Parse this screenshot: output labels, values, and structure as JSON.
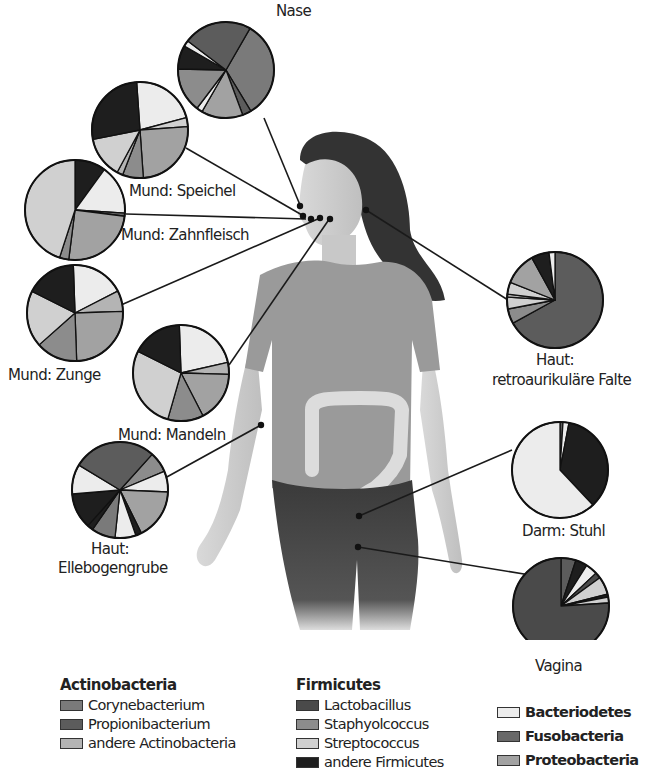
{
  "legend": {
    "groups": [
      {
        "title": "Actinobacteria",
        "items": [
          {
            "key": "cory",
            "label": "Corynebacterium",
            "color": "#7a7a7a"
          },
          {
            "key": "prop",
            "label": "Propionibacterium",
            "color": "#5c5c5c"
          },
          {
            "key": "acto",
            "label": "andere Actinobacteria",
            "color": "#b4b4b4"
          }
        ]
      },
      {
        "title": "Firmicutes",
        "items": [
          {
            "key": "lact",
            "label": "Lactobacillus",
            "color": "#4a4a4a"
          },
          {
            "key": "stap",
            "label": "Staphyolcoccus",
            "color": "#8c8c8c"
          },
          {
            "key": "stre",
            "label": "Streptococcus",
            "color": "#d0d0d0"
          },
          {
            "key": "firo",
            "label": "andere Firmicutes",
            "color": "#1e1e1e"
          }
        ]
      },
      {
        "title": "",
        "items": [
          {
            "key": "bact",
            "label": "Bacteriodetes",
            "color": "#ececec"
          },
          {
            "key": "fuso",
            "label": "Fusobacteria",
            "color": "#686868"
          },
          {
            "key": "prot",
            "label": "Proteobacteria",
            "color": "#a2a2a2"
          }
        ]
      }
    ]
  },
  "chart_data": {
    "type": "pie",
    "legend_position": "bottom",
    "series": [
      {
        "name": "Nase",
        "cx": 226,
        "cy": 70,
        "r": 48,
        "start": -60,
        "slices": [
          [
            "cory",
            33
          ],
          [
            "prop",
            3
          ],
          [
            "prot",
            14
          ],
          [
            "bact",
            2
          ],
          [
            "stap",
            15
          ],
          [
            "firo",
            8
          ],
          [
            "bact",
            2
          ],
          [
            "prop",
            23
          ]
        ]
      },
      {
        "name": "Mund: Speichel",
        "cx": 140,
        "cy": 130,
        "r": 48,
        "start": -94,
        "slices": [
          [
            "bact",
            22
          ],
          [
            "stre",
            3
          ],
          [
            "prot",
            25
          ],
          [
            "stap",
            7
          ],
          [
            "acto",
            2
          ],
          [
            "stre",
            14
          ],
          [
            "firo",
            27
          ]
        ]
      },
      {
        "name": "Mund: Zahnfleisch",
        "cx": 75,
        "cy": 210,
        "r": 50,
        "start": -90,
        "slices": [
          [
            "firo",
            10
          ],
          [
            "bact",
            16
          ],
          [
            "fuso",
            1
          ],
          [
            "prot",
            25
          ],
          [
            "stap",
            3
          ],
          [
            "stre",
            45
          ]
        ]
      },
      {
        "name": "Mund: Zunge",
        "cx": 75,
        "cy": 313,
        "r": 48,
        "start": -92,
        "slices": [
          [
            "bact",
            18
          ],
          [
            "acto",
            7
          ],
          [
            "prot",
            25
          ],
          [
            "stap",
            14
          ],
          [
            "stre",
            19
          ],
          [
            "firo",
            17
          ]
        ]
      },
      {
        "name": "Mund: Mandeln",
        "cx": 181,
        "cy": 373,
        "r": 48,
        "start": -92,
        "slices": [
          [
            "bact",
            22
          ],
          [
            "acto",
            4
          ],
          [
            "prot",
            17
          ],
          [
            "stap",
            12
          ],
          [
            "stre",
            28
          ],
          [
            "firo",
            17
          ]
        ]
      },
      {
        "name": "Haut: Ellebogengrube",
        "cx": 120,
        "cy": 490,
        "r": 48,
        "start": -48,
        "slices": [
          [
            "stap",
            7
          ],
          [
            "bact",
            7
          ],
          [
            "prot",
            17
          ],
          [
            "firo",
            2
          ],
          [
            "bact",
            7
          ],
          [
            "cory",
            8
          ],
          [
            "firo",
            2
          ],
          [
            "firo",
            12
          ],
          [
            "bact",
            10
          ],
          [
            "prop",
            28
          ]
        ]
      },
      {
        "name": "Haut: retroaurikuläre Falte",
        "cx": 555,
        "cy": 300,
        "r": 48,
        "start": -90,
        "slices": [
          [
            "prop",
            67
          ],
          [
            "stap",
            5
          ],
          [
            "stre",
            4
          ],
          [
            "acto",
            1
          ],
          [
            "stre",
            4
          ],
          [
            "prot",
            11
          ],
          [
            "firo",
            6
          ],
          [
            "bact",
            2
          ]
        ]
      },
      {
        "name": "Darm: Stuhl",
        "cx": 560,
        "cy": 470,
        "r": 48,
        "start": -90,
        "slices": [
          [
            "prop",
            1
          ],
          [
            "bact",
            2
          ],
          [
            "firo",
            35
          ],
          [
            "bact",
            62
          ]
        ]
      },
      {
        "name": "Vagina",
        "cx": 561,
        "cy": 606,
        "r": 48,
        "start": -90,
        "slices": [
          [
            "prop",
            5
          ],
          [
            "firo",
            4
          ],
          [
            "bact",
            4
          ],
          [
            "lact",
            2
          ],
          [
            "stre",
            6
          ],
          [
            "firo",
            1
          ],
          [
            "stre",
            2
          ],
          [
            "lact",
            76
          ]
        ]
      }
    ]
  },
  "labels": [
    {
      "id": "nase",
      "text": "Nase",
      "x": 276,
      "y": 2
    },
    {
      "id": "speichel",
      "text": "Mund: Speichel",
      "x": 129,
      "y": 182
    },
    {
      "id": "zahnfleisch",
      "text": "Mund: Zahnfleisch",
      "x": 121,
      "y": 226
    },
    {
      "id": "zunge",
      "text": "Mund: Zunge",
      "x": 8,
      "y": 366
    },
    {
      "id": "mandeln",
      "text": "Mund: Mandeln",
      "x": 118,
      "y": 426
    },
    {
      "id": "ellbogen1",
      "text": "Haut:",
      "x": 91,
      "y": 540
    },
    {
      "id": "ellbogen2",
      "text": "Ellebogengrube",
      "x": 58,
      "y": 559
    },
    {
      "id": "retro1",
      "text": "Haut:",
      "x": 536,
      "y": 351
    },
    {
      "id": "retro2",
      "text": "retroaurikuläre Falte",
      "x": 492,
      "y": 371
    },
    {
      "id": "stuhl",
      "text": "Darm: Stuhl",
      "x": 522,
      "y": 522
    },
    {
      "id": "vagina",
      "text": "Vagina",
      "x": 535,
      "y": 657
    }
  ],
  "leaders": [
    {
      "from": [
        264,
        118
      ],
      "to": [
        300,
        205
      ]
    },
    {
      "from": [
        186,
        148
      ],
      "to": [
        302,
        215
      ]
    },
    {
      "from": [
        126,
        214
      ],
      "to": [
        306,
        219
      ]
    },
    {
      "from": [
        121,
        305
      ],
      "to": [
        320,
        218
      ]
    },
    {
      "from": [
        229,
        365
      ],
      "to": [
        330,
        218
      ]
    },
    {
      "from": [
        165,
        478
      ],
      "to": [
        261,
        425
      ]
    },
    {
      "from": [
        508,
        300
      ],
      "to": [
        366,
        210
      ]
    },
    {
      "from": [
        512,
        450
      ],
      "to": [
        359,
        516
      ]
    },
    {
      "from": [
        530,
        575
      ],
      "to": [
        358,
        547
      ]
    }
  ],
  "markers": [
    [
      300,
      206
    ],
    [
      303,
      216
    ],
    [
      311,
      219
    ],
    [
      320,
      218
    ],
    [
      330,
      219
    ],
    [
      366,
      210
    ],
    [
      261,
      425
    ],
    [
      359,
      516
    ],
    [
      358,
      547
    ]
  ]
}
